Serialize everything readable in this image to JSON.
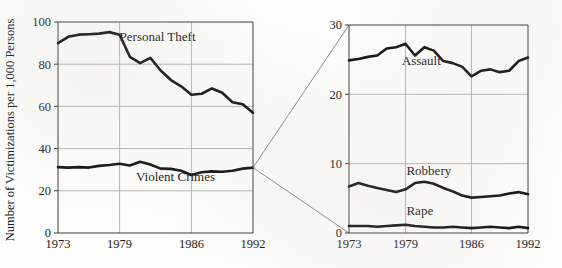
{
  "figure": {
    "background_color": "#fdfdfb",
    "ink_color": "#111111",
    "grid_color": "#a9a9a9",
    "connector_color": "#7b7b7b",
    "y_axis_title": "Number of Victimizations per 1,000 Persons"
  },
  "chart_data": [
    {
      "id": "left",
      "type": "line",
      "title": "",
      "xlabel": "",
      "ylabel": "Number of Victimizations per 1,000 Persons",
      "x": [
        1973,
        1974,
        1975,
        1976,
        1977,
        1978,
        1979,
        1980,
        1981,
        1982,
        1983,
        1984,
        1985,
        1986,
        1987,
        1988,
        1989,
        1990,
        1991,
        1992
      ],
      "xlim": [
        1973,
        1992
      ],
      "ylim": [
        0,
        100
      ],
      "xticks": [
        1973,
        1979,
        1986,
        1992
      ],
      "xticklabels": [
        "1973",
        "1979",
        "1986",
        "1992"
      ],
      "yticks": [
        0,
        20,
        40,
        60,
        80,
        100
      ],
      "yticklabels": [
        "0",
        "20",
        "40",
        "60",
        "80",
        "100"
      ],
      "grid": true,
      "legend": "inline-annotations",
      "series": [
        {
          "name": "Personal Theft",
          "label_x": 1979.0,
          "label_y": 91.0,
          "values": [
            90.0,
            93.0,
            94.0,
            94.2,
            94.5,
            95.2,
            94.0,
            83.5,
            80.5,
            83.0,
            77.0,
            72.5,
            69.5,
            65.5,
            66.0,
            68.5,
            66.5,
            62.0,
            61.0,
            57.0
          ]
        },
        {
          "name": "Violent Crimes",
          "label_x": 1980.6,
          "label_y": 24.5,
          "values": [
            31.2,
            31.0,
            31.2,
            31.0,
            31.8,
            32.2,
            32.8,
            32.0,
            33.8,
            32.5,
            30.5,
            30.4,
            29.5,
            27.5,
            28.8,
            29.2,
            29.0,
            29.5,
            30.5,
            31.0
          ]
        }
      ]
    },
    {
      "id": "right",
      "type": "line",
      "title": "",
      "xlabel": "",
      "ylabel": "",
      "x": [
        1973,
        1974,
        1975,
        1976,
        1977,
        1978,
        1979,
        1980,
        1981,
        1982,
        1983,
        1984,
        1985,
        1986,
        1987,
        1988,
        1989,
        1990,
        1991,
        1992
      ],
      "xlim": [
        1973,
        1992
      ],
      "ylim": [
        0,
        30
      ],
      "xticks": [
        1973,
        1979,
        1986,
        1992
      ],
      "xticklabels": [
        "1973",
        "1979",
        "1986",
        "1992"
      ],
      "yticks": [
        0,
        10,
        20,
        30
      ],
      "yticklabels": [
        "0",
        "10",
        "20",
        "30"
      ],
      "grid": true,
      "legend": "inline-annotations",
      "series": [
        {
          "name": "Assault",
          "label_x": 1978.6,
          "label_y": 24.3,
          "values": [
            24.9,
            25.1,
            25.4,
            25.6,
            26.6,
            26.8,
            27.3,
            25.6,
            26.8,
            26.3,
            24.8,
            24.5,
            24.0,
            22.6,
            23.4,
            23.6,
            23.2,
            23.4,
            24.8,
            25.3
          ]
        },
        {
          "name": "Robbery",
          "label_x": 1979.1,
          "label_y": 8.4,
          "values": [
            6.7,
            7.2,
            6.8,
            6.5,
            6.2,
            5.9,
            6.3,
            7.2,
            7.4,
            7.1,
            6.5,
            6.0,
            5.4,
            5.1,
            5.2,
            5.3,
            5.4,
            5.7,
            5.9,
            5.6
          ]
        },
        {
          "name": "Rape",
          "label_x": 1979.1,
          "label_y": 2.6,
          "values": [
            1.0,
            1.0,
            1.0,
            0.9,
            1.0,
            1.1,
            1.2,
            1.0,
            0.9,
            0.8,
            0.8,
            0.9,
            0.8,
            0.7,
            0.8,
            0.9,
            0.8,
            0.7,
            0.9,
            0.7
          ]
        }
      ]
    }
  ],
  "connectors": [
    {
      "name": "upper-connector",
      "from": {
        "chart": "left",
        "x": 1992,
        "y": 31.0
      },
      "to": {
        "chart": "right",
        "x": 1973,
        "y": 30
      }
    },
    {
      "name": "lower-connector",
      "from": {
        "chart": "left",
        "x": 1992,
        "y": 31.0
      },
      "to": {
        "chart": "right",
        "x": 1973,
        "y": 0
      }
    }
  ]
}
